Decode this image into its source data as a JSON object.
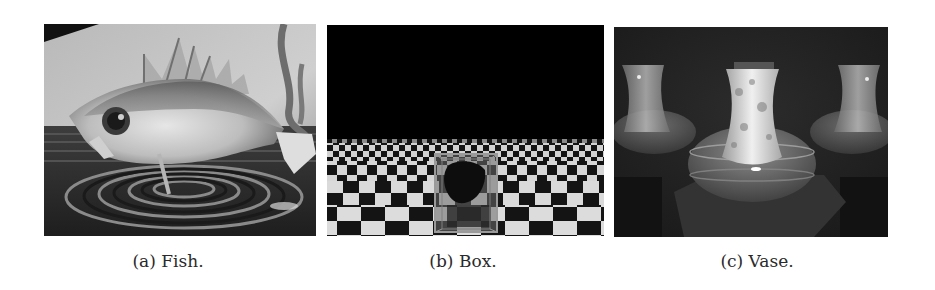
{
  "figure": {
    "subfigures": [
      {
        "id": "a",
        "caption": "(a) Fish.",
        "scene": "fish"
      },
      {
        "id": "b",
        "caption": "(b) Box.",
        "scene": "box"
      },
      {
        "id": "c",
        "caption": "(c) Vase.",
        "scene": "vase"
      }
    ]
  }
}
